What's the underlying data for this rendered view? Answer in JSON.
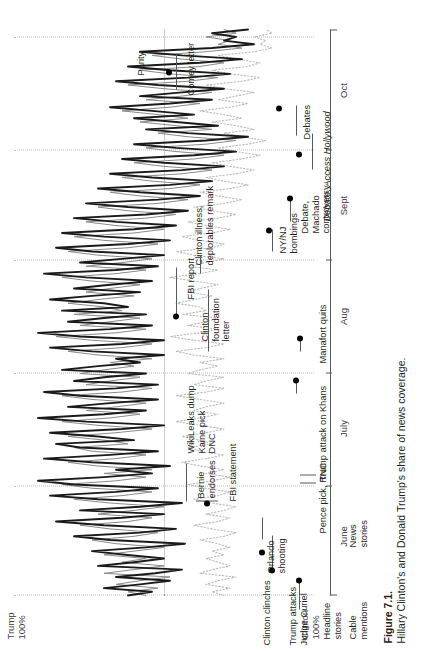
{
  "figure": {
    "number": "Figure 7.1.",
    "caption": "Hillary Clinton's and Donald Trump's share of news coverage."
  },
  "axis_labels": {
    "top_left": "Trump\n100%",
    "top_left_line1": "Trump",
    "top_left_line2": "100%",
    "bottom_left_line1": "Clinton",
    "bottom_left_line2": "100%",
    "parity": "Parity"
  },
  "series_keys": [
    {
      "name": "headline-stories",
      "line1": "Headline",
      "line2": "stories"
    },
    {
      "name": "cable-mentions",
      "line1": "Cable",
      "line2": "mentions"
    },
    {
      "name": "news-stories",
      "line1": "News",
      "line2": "stories"
    }
  ],
  "annotations": [
    {
      "id": "trump-attacks-curiel",
      "line1": "Trump attacks",
      "line2": "Judge Curiel",
      "italic": false
    },
    {
      "id": "clinton-clinches",
      "line1": "Clinton clinches",
      "line2": "",
      "italic": false
    },
    {
      "id": "orlando-shooting",
      "line1": "Orlando",
      "line2": "shooting",
      "italic": false
    },
    {
      "id": "pence-pick-rnc",
      "line1": "Pence pick, RNC",
      "line2": "",
      "italic": false
    },
    {
      "id": "bernie-endorses",
      "line1": "Bernie",
      "line2": "endorses",
      "italic": false
    },
    {
      "id": "fbi-statement",
      "line1": "FBI statement",
      "line2": "",
      "italic": false
    },
    {
      "id": "wikileaks-kaine-dnc",
      "line1": "WikiLeaks dump",
      "line2": "Kaine pick",
      "line3": "DNC",
      "italic": false
    },
    {
      "id": "trump-attack-khans",
      "line1": "Trump attack on Khans",
      "line2": "",
      "italic": false
    },
    {
      "id": "manafort-quits",
      "line1": "Manafort quits",
      "line2": "",
      "italic": false
    },
    {
      "id": "clinton-foundation-letter",
      "line1": "Clinton",
      "line2": "foundation",
      "line3": "letter",
      "italic": false
    },
    {
      "id": "fbi-report",
      "line1": "FBI report",
      "line2": "",
      "italic": false
    },
    {
      "id": "clinton-illness-deplorables",
      "line1": "Clinton illness,",
      "line2": "deplorables remark",
      "italic": false
    },
    {
      "id": "ny-nj-bombings",
      "line1": "NY/NJ",
      "line2": "bombings",
      "italic": false
    },
    {
      "id": "debate-machado",
      "line1": "Debate,",
      "line2": "Machado",
      "line3": "controversy",
      "italic": false
    },
    {
      "id": "access-hollywood",
      "line1": "Debate, Access Hollywood",
      "line2": "",
      "italic": true
    },
    {
      "id": "debates",
      "line1": "Debates",
      "line2": "",
      "italic": false
    },
    {
      "id": "comey-letter",
      "line1": "Comey letter",
      "line2": "",
      "italic": false
    }
  ],
  "chart_data": {
    "type": "line",
    "title": "Hillary Clinton's and Donald Trump's share of news coverage.",
    "xlabel": "",
    "ylabel": "Share of news coverage",
    "ylim": [
      0,
      100
    ],
    "ytick_labels": [
      "Trump 100%",
      "Parity",
      "Clinton 100%"
    ],
    "ytick_values": [
      100,
      50,
      0
    ],
    "grid": "vertical dotted monthly gridlines; dotted horizontal parity line",
    "legend": "inline labels at left of each trace",
    "categories": [
      "June",
      "July",
      "Aug",
      "Sept",
      "Oct"
    ],
    "xtick_labels": [
      "June",
      "July",
      "Aug",
      "Sept",
      "Oct"
    ],
    "series": [
      {
        "name": "Headline stories",
        "style": "thick solid black",
        "x": [
          0,
          1,
          2,
          3,
          4,
          5,
          6,
          7,
          8,
          9,
          10,
          11,
          12,
          13,
          14,
          15,
          16,
          17,
          18,
          19,
          20,
          21,
          22,
          23,
          24,
          25,
          26,
          27,
          28,
          29,
          30,
          31,
          32,
          33,
          34,
          35,
          36,
          37,
          38,
          39,
          40,
          41,
          42,
          43,
          44,
          45,
          46,
          47,
          48,
          49,
          50,
          51,
          52,
          53,
          54,
          55,
          56,
          57,
          58,
          59,
          60,
          61,
          62,
          63,
          64,
          65,
          66,
          67,
          68,
          69,
          70,
          71,
          72,
          73,
          74,
          75,
          76,
          77,
          78,
          79,
          80,
          81,
          82,
          83,
          84,
          85,
          86,
          87,
          88,
          89,
          90,
          91,
          92,
          93,
          94,
          95,
          96,
          97,
          98,
          99,
          100,
          101,
          102,
          103,
          104,
          105,
          106,
          107,
          108,
          109,
          110,
          111,
          112,
          113,
          114,
          115,
          116,
          117,
          118,
          119,
          120,
          121,
          122,
          123,
          124,
          125,
          126,
          127,
          128,
          129,
          130,
          131,
          132,
          133,
          134,
          135,
          136,
          137,
          138,
          139,
          140,
          141,
          142,
          143,
          144,
          145,
          146,
          147,
          148,
          149,
          150,
          151,
          152,
          153
        ],
        "values": [
          62,
          54,
          70,
          58,
          48,
          66,
          53,
          44,
          72,
          60,
          50,
          63,
          74,
          56,
          43,
          68,
          80,
          58,
          46,
          70,
          86,
          64,
          50,
          78,
          58,
          44,
          72,
          88,
          66,
          52,
          80,
          92,
          70,
          54,
          66,
          48,
          74,
          90,
          68,
          52,
          78,
          86,
          60,
          72,
          88,
          64,
          50,
          76,
          92,
          70,
          56,
          82,
          68,
          52,
          78,
          90,
          66,
          52,
          80,
          70,
          56,
          84,
          72,
          58,
          66,
          50,
          74,
          88,
          64,
          50,
          78,
          92,
          68,
          54,
          82,
          70,
          56,
          84,
          62,
          70,
          88,
          74,
          58,
          80,
          68,
          54,
          76,
          90,
          66,
          52,
          78,
          64,
          50,
          74,
          86,
          62,
          48,
          70,
          84,
          60,
          46,
          66,
          80,
          56,
          42,
          62,
          76,
          52,
          38,
          58,
          72,
          48,
          34,
          54,
          68,
          44,
          30,
          50,
          64,
          40,
          26,
          46,
          60,
          36,
          22,
          42,
          56,
          32,
          46,
          60,
          40,
          54,
          68,
          48,
          34,
          58,
          44,
          30,
          52,
          66,
          42,
          28,
          48,
          62,
          38,
          24,
          44,
          58,
          34,
          20,
          30,
          26,
          34,
          22
        ]
      },
      {
        "name": "Cable mentions",
        "style": "thin solid gray",
        "x": [
          0,
          1,
          2,
          3,
          4,
          5,
          6,
          7,
          8,
          9,
          10,
          11,
          12,
          13,
          14,
          15,
          16,
          17,
          18,
          19,
          20,
          21,
          22,
          23,
          24,
          25,
          26,
          27,
          28,
          29,
          30,
          31,
          32,
          33,
          34,
          35,
          36,
          37,
          38,
          39,
          40,
          41,
          42,
          43,
          44,
          45,
          46,
          47,
          48,
          49,
          50,
          51,
          52,
          53,
          54,
          55,
          56,
          57,
          58,
          59,
          60,
          61,
          62,
          63,
          64,
          65,
          66,
          67,
          68,
          69,
          70,
          71,
          72,
          73,
          74,
          75,
          76,
          77,
          78,
          79,
          80,
          81,
          82,
          83,
          84,
          85,
          86,
          87,
          88,
          89,
          90,
          91,
          92,
          93,
          94,
          95,
          96,
          97,
          98,
          99,
          100,
          101,
          102,
          103,
          104,
          105,
          106,
          107,
          108,
          109,
          110,
          111,
          112,
          113,
          114,
          115,
          116,
          117,
          118,
          119,
          120,
          121,
          122,
          123,
          124,
          125,
          126,
          127,
          128,
          129,
          130,
          131,
          132,
          133,
          134,
          135,
          136,
          137,
          138,
          139,
          140,
          141,
          142,
          143,
          144,
          145,
          146,
          147,
          148,
          149,
          150,
          151,
          152,
          153
        ],
        "values": [
          56,
          62,
          52,
          66,
          58,
          48,
          70,
          60,
          50,
          64,
          56,
          70,
          60,
          50,
          66,
          74,
          60,
          52,
          68,
          78,
          62,
          54,
          72,
          60,
          50,
          68,
          80,
          64,
          54,
          74,
          84,
          66,
          56,
          70,
          54,
          72,
          82,
          66,
          56,
          74,
          80,
          62,
          70,
          82,
          66,
          54,
          72,
          84,
          68,
          58,
          76,
          66,
          56,
          74,
          84,
          64,
          54,
          76,
          68,
          58,
          78,
          70,
          60,
          68,
          54,
          72,
          82,
          64,
          54,
          74,
          86,
          66,
          56,
          78,
          68,
          58,
          80,
          64,
          70,
          82,
          72,
          60,
          76,
          68,
          58,
          74,
          84,
          66,
          56,
          76,
          64,
          54,
          72,
          82,
          62,
          52,
          70,
          80,
          60,
          50,
          66,
          76,
          56,
          46,
          62,
          72,
          52,
          42,
          58,
          68,
          48,
          38,
          54,
          64,
          44,
          34,
          50,
          60,
          40,
          30,
          46,
          56,
          36,
          26,
          42,
          52,
          34,
          46,
          58,
          42,
          52,
          64,
          48,
          38,
          56,
          44,
          34,
          50,
          62,
          42,
          32,
          48,
          58,
          38,
          30,
          44,
          54,
          36,
          24,
          32,
          28,
          36,
          26,
          30
        ]
      },
      {
        "name": "News stories",
        "style": "dotted light gray",
        "x": [
          0,
          1,
          2,
          3,
          4,
          5,
          6,
          7,
          8,
          9,
          10,
          11,
          12,
          13,
          14,
          15,
          16,
          17,
          18,
          19,
          20,
          21,
          22,
          23,
          24,
          25,
          26,
          27,
          28,
          29,
          30,
          31,
          32,
          33,
          34,
          35,
          36,
          37,
          38,
          39,
          40,
          41,
          42,
          43,
          44,
          45,
          46,
          47,
          48,
          49,
          50,
          51,
          52,
          53,
          54,
          55,
          56,
          57,
          58,
          59,
          60,
          61,
          62,
          63,
          64,
          65,
          66,
          67,
          68,
          69,
          70,
          71,
          72,
          73,
          74,
          75,
          76,
          77,
          78,
          79,
          80,
          81,
          82,
          83,
          84,
          85,
          86,
          87,
          88,
          89,
          90,
          91,
          92,
          93,
          94,
          95,
          96,
          97,
          98,
          99,
          100,
          101,
          102,
          103,
          104,
          105,
          106,
          107,
          108,
          109,
          110,
          111,
          112,
          113,
          114,
          115,
          116,
          117,
          118,
          119,
          120,
          121,
          122,
          123,
          124,
          125,
          126,
          127,
          128,
          129,
          130,
          131,
          132,
          133,
          134,
          135,
          136,
          137,
          138,
          139,
          140,
          141,
          142,
          143,
          144,
          145,
          146,
          147,
          148,
          149,
          150,
          151,
          152,
          153
        ],
        "values": [
          30,
          34,
          28,
          36,
          32,
          26,
          38,
          34,
          28,
          32,
          36,
          30,
          34,
          28,
          32,
          38,
          30,
          26,
          34,
          40,
          32,
          28,
          36,
          30,
          26,
          34,
          40,
          32,
          28,
          36,
          42,
          34,
          28,
          36,
          30,
          38,
          44,
          36,
          30,
          38,
          42,
          34,
          38,
          44,
          36,
          30,
          38,
          46,
          38,
          32,
          40,
          36,
          30,
          38,
          46,
          36,
          30,
          40,
          36,
          30,
          42,
          38,
          32,
          38,
          30,
          40,
          46,
          36,
          30,
          40,
          48,
          38,
          32,
          42,
          36,
          32,
          44,
          36,
          38,
          46,
          40,
          34,
          42,
          38,
          32,
          40,
          48,
          38,
          32,
          42,
          36,
          30,
          40,
          46,
          34,
          30,
          38,
          44,
          34,
          28,
          36,
          42,
          32,
          26,
          34,
          40,
          30,
          24,
          32,
          38,
          28,
          22,
          30,
          36,
          26,
          20,
          28,
          34,
          24,
          18,
          26,
          32,
          22,
          16,
          24,
          30,
          20,
          26,
          34,
          24,
          30,
          38,
          28,
          22,
          32,
          26,
          20,
          30,
          36,
          24,
          18,
          28,
          34,
          22,
          18,
          26,
          32,
          20,
          14,
          18,
          16,
          20,
          14,
          16
        ]
      }
    ],
    "event_markers": [
      {
        "label": "Trump attacks Judge Curiel",
        "approx_x_pct": 4
      },
      {
        "label": "Clinton clinches",
        "approx_x_pct": 7
      },
      {
        "label": "Orlando shooting",
        "approx_x_pct": 12
      },
      {
        "label": "Pence pick, RNC",
        "approx_x_pct": 29
      },
      {
        "label": "Bernie endorses",
        "approx_x_pct": 22
      },
      {
        "label": "FBI statement",
        "approx_x_pct": 20
      },
      {
        "label": "WikiLeaks dump / Kaine pick / DNC",
        "approx_x_pct": 32
      },
      {
        "label": "Trump attack on Khans",
        "approx_x_pct": 40
      },
      {
        "label": "Manafort quits",
        "approx_x_pct": 47
      },
      {
        "label": "Clinton foundation letter",
        "approx_x_pct": 52
      },
      {
        "label": "FBI report",
        "approx_x_pct": 57
      },
      {
        "label": "Clinton illness, deplorables remark",
        "approx_x_pct": 62
      },
      {
        "label": "NY/NJ bombings",
        "approx_x_pct": 70
      },
      {
        "label": "Debate, Machado controversy",
        "approx_x_pct": 74
      },
      {
        "label": "Debate, Access Hollywood",
        "approx_x_pct": 80
      },
      {
        "label": "Debates",
        "approx_x_pct": 86
      },
      {
        "label": "Comey letter",
        "approx_x_pct": 94
      }
    ]
  }
}
